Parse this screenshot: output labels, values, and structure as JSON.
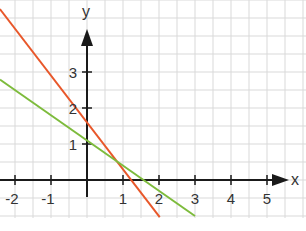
{
  "chart_data": {
    "type": "line",
    "title": "",
    "xlabel": "x",
    "ylabel": "y",
    "xlim": [
      -2.42,
      6.0
    ],
    "ylim": [
      -1.05,
      5.0
    ],
    "grid": true,
    "grid_step": 0.5,
    "x_ticks": [
      -2,
      -1,
      1,
      2,
      3,
      4,
      5
    ],
    "x_tick_labels": [
      "-2",
      "-1",
      "1",
      "2",
      "3",
      "4",
      "5"
    ],
    "y_ticks": [
      1,
      2,
      3
    ],
    "y_tick_labels": [
      "1",
      "2",
      "3"
    ],
    "extra_tick_marks": [
      0
    ],
    "legend": null,
    "series": [
      {
        "name": "orange line",
        "color": "#e8572a",
        "slope": -1.3,
        "intercept": 1.6,
        "x": [
          -2.42,
          2.02
        ],
        "y": [
          4.75,
          -1.03
        ]
      },
      {
        "name": "green line",
        "color": "#7dbb3c",
        "slope": -0.7,
        "intercept": 1.1,
        "x": [
          -2.42,
          3.0
        ],
        "y": [
          2.79,
          -1.0
        ]
      }
    ],
    "intersection": {
      "x": 0.83,
      "y": 0.52
    }
  },
  "layout": {
    "origin_px": [
      87,
      180
    ],
    "unit_px": 36,
    "plot_bottom_px": 218,
    "axis_color": "#1a1a1a",
    "grid_color": "#d9d9d9"
  }
}
